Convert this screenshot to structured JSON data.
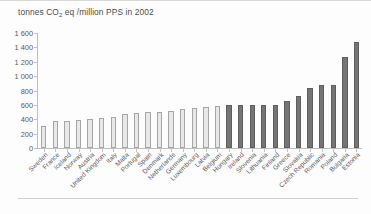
{
  "figure": {
    "title_main": "tonnes CO",
    "title_sub": "2",
    "title_rest": " eq /million PPS in 2002"
  },
  "colors": {
    "bar_light_fill": "#e8e8e8",
    "bar_light_border": "#a6a6a6",
    "bar_dark_fill": "#757575",
    "bar_dark_border": "#5e5e5e",
    "axis": "#bfbfbf",
    "text": "#595959",
    "background": "#fdfdfd"
  },
  "chart_data": {
    "type": "bar",
    "title": "tonnes CO2 eq /million PPS in 2002",
    "xlabel": "",
    "ylabel": "",
    "ylim": [
      0,
      1600
    ],
    "yticks": [
      0,
      200,
      400,
      600,
      800,
      1000,
      1200,
      1400,
      1600
    ],
    "ytick_labels": [
      "0",
      "200",
      "400",
      "600",
      "800",
      "1 000",
      "1 200",
      "1 400",
      "1 600"
    ],
    "grid": false,
    "legend": "none",
    "orientation": "vertical",
    "categories": [
      "Sweden",
      "France",
      "Iceland",
      "Norway",
      "Austria",
      "United Kingdom",
      "Italy",
      "Malta",
      "Portugal",
      "Spain",
      "Denmark",
      "Netherlands",
      "Germany",
      "Luxembourg",
      "Latvia",
      "Belgium",
      "Hungary",
      "Ireland",
      "Slovenia",
      "Lithuania",
      "Finland",
      "Greece",
      "Slovakia",
      "Czech Republic",
      "Romania",
      "Poland",
      "Bulgaria",
      "Estonia"
    ],
    "values": [
      300,
      380,
      375,
      385,
      400,
      415,
      430,
      470,
      490,
      500,
      500,
      520,
      540,
      560,
      575,
      585,
      600,
      600,
      605,
      605,
      600,
      660,
      730,
      830,
      870,
      880,
      1270,
      1470
    ],
    "series": [
      {
        "name": "tonnes CO2 eq per million PPS",
        "values": [
          300,
          380,
          375,
          385,
          400,
          415,
          430,
          470,
          490,
          500,
          500,
          520,
          540,
          560,
          575,
          585,
          600,
          600,
          605,
          605,
          600,
          660,
          730,
          830,
          870,
          880,
          1270,
          1470
        ]
      }
    ],
    "bar_styles": [
      "light",
      "light",
      "light",
      "light",
      "light",
      "light",
      "light",
      "light",
      "light",
      "light",
      "light",
      "light",
      "light",
      "light",
      "light",
      "light",
      "dark",
      "dark",
      "dark",
      "dark",
      "dark",
      "dark",
      "dark",
      "dark",
      "dark",
      "dark",
      "dark",
      "dark"
    ]
  }
}
